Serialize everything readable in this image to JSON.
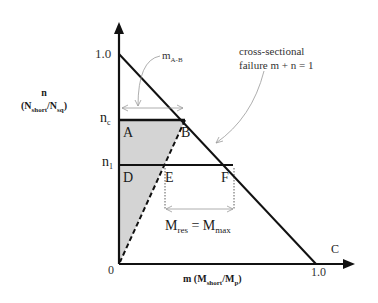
{
  "diagram": {
    "type": "interaction-diagram",
    "y_axis": {
      "symbol": "n",
      "ratio_num": "N",
      "ratio_num_sub": "short",
      "ratio_den": "N",
      "ratio_den_sub": "sq",
      "ticks": {
        "top": "1.0",
        "nc": "n",
        "nc_sub": "c",
        "n1": "n",
        "n1_sub": "1",
        "origin": "0"
      }
    },
    "x_axis": {
      "symbol": "m",
      "ratio_num": "M",
      "ratio_num_sub": "short",
      "ratio_den": "M",
      "ratio_den_sub": "p",
      "ticks": {
        "end": "1.0"
      }
    },
    "points": {
      "A": "A",
      "B": "B",
      "C": "C",
      "D": "D",
      "E": "E",
      "F": "F"
    },
    "annotations": {
      "m_ab": "m",
      "m_ab_sub": "A-B",
      "failure_line1": "cross-sectional",
      "failure_line2": "failure m + n = 1",
      "mres_M1": "M",
      "mres_sub1": "res",
      "mres_eq": " = ",
      "mres_M2": "M",
      "mres_sub2": "max"
    },
    "colors": {
      "line": "#111111",
      "shade": "#d4d4d4",
      "annotation": "#888888"
    }
  }
}
